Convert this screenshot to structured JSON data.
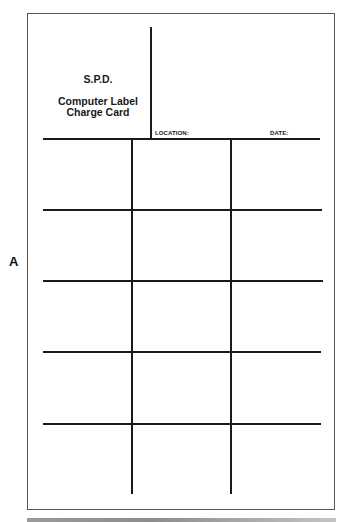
{
  "figure": {
    "side_label": "A"
  },
  "card": {
    "header": {
      "org": "S.P.D.",
      "title_line1": "Computer Label",
      "title_line2": "Charge Card"
    },
    "fields": {
      "location_label": "LOCATION:",
      "date_label": "DATE:"
    },
    "grid": {
      "columns": 3,
      "rows": 5,
      "cells": [
        [
          "",
          "",
          ""
        ],
        [
          "",
          "",
          ""
        ],
        [
          "",
          "",
          ""
        ],
        [
          "",
          "",
          ""
        ],
        [
          "",
          "",
          ""
        ]
      ]
    }
  },
  "colors": {
    "line": "#1a1a1a",
    "border": "#555555",
    "background": "#ffffff"
  }
}
